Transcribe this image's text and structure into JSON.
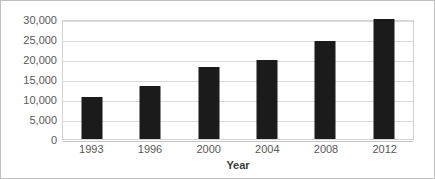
{
  "chart_data": {
    "type": "bar",
    "title": "",
    "subtitle": "",
    "xlabel": "Year",
    "ylabel": "",
    "categories": [
      "1993",
      "1996",
      "2000",
      "2004",
      "2008",
      "2012"
    ],
    "values": [
      10500,
      13250,
      18000,
      19750,
      24500,
      30000
    ],
    "series": [
      {
        "name": "",
        "values": [
          10500,
          13250,
          18000,
          19750,
          24500,
          30000
        ]
      }
    ],
    "ylim": [
      0,
      30000
    ],
    "y_tick_values": [
      0,
      5000,
      10000,
      15000,
      20000,
      25000,
      30000
    ],
    "y_tick_labels": [
      "0",
      "5,000",
      "10,000",
      "15,000",
      "20,000",
      "25,000",
      "30,000"
    ],
    "x_tick_labels": [
      "1993",
      "1996",
      "2000",
      "2004",
      "2008",
      "2012"
    ],
    "grid": true,
    "grid_orientation": "horizontal",
    "legend": false,
    "legend_position": "none",
    "annotations": [],
    "colors": {
      "bar": "#1b1b1b",
      "gridline": "#d9d9d9",
      "plot_border": "#d4d4d4",
      "frame_border": "#bfbfbf",
      "background": "#ffffff",
      "tick_label": "#585858",
      "axis_title": "#3b3b3b"
    }
  }
}
